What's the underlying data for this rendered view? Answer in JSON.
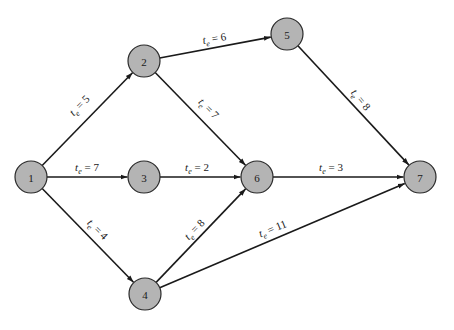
{
  "diagram": {
    "type": "activity-on-node network (PERT)",
    "node_radius": 16,
    "colors": {
      "node_fill": "#b4b4b4",
      "node_stroke": "#2a2a2a",
      "edge": "#1a1a1a",
      "background": "#ffffff"
    },
    "nodes": [
      {
        "id": "1",
        "label": "1",
        "x": 31,
        "y": 177
      },
      {
        "id": "2",
        "label": "2",
        "x": 144,
        "y": 61
      },
      {
        "id": "3",
        "label": "3",
        "x": 144,
        "y": 177
      },
      {
        "id": "4",
        "label": "4",
        "x": 145,
        "y": 294
      },
      {
        "id": "5",
        "label": "5",
        "x": 287,
        "y": 34
      },
      {
        "id": "6",
        "label": "6",
        "x": 257,
        "y": 177
      },
      {
        "id": "7",
        "label": "7",
        "x": 420,
        "y": 177
      }
    ],
    "edges": [
      {
        "from": "1",
        "to": "2",
        "var": "t",
        "sub": "e",
        "value": "5",
        "label": "t_e = 5",
        "lx": 82,
        "ly": 108,
        "angle": -46
      },
      {
        "from": "1",
        "to": "3",
        "var": "t",
        "sub": "e",
        "value": "7",
        "label": "t_e = 7",
        "lx": 87,
        "ly": 171,
        "angle": 0
      },
      {
        "from": "1",
        "to": "4",
        "var": "t",
        "sub": "e",
        "value": "4",
        "label": "t_e = 4",
        "lx": 95,
        "ly": 232,
        "angle": 45
      },
      {
        "from": "2",
        "to": "5",
        "var": "t",
        "sub": "e",
        "value": "6",
        "label": "t_e = 6",
        "lx": 215,
        "ly": 42,
        "angle": -10
      },
      {
        "from": "2",
        "to": "6",
        "var": "t",
        "sub": "e",
        "value": "7",
        "label": "t_e = 7",
        "lx": 206,
        "ly": 111,
        "angle": 46
      },
      {
        "from": "3",
        "to": "6",
        "var": "t",
        "sub": "e",
        "value": "2",
        "label": "t_e = 2",
        "lx": 197,
        "ly": 171,
        "angle": 0
      },
      {
        "from": "4",
        "to": "6",
        "var": "t",
        "sub": "e",
        "value": "8",
        "label": "t_e = 8",
        "lx": 197,
        "ly": 232,
        "angle": -46
      },
      {
        "from": "5",
        "to": "7",
        "var": "t",
        "sub": "e",
        "value": "8",
        "label": "t_e = 8",
        "lx": 358,
        "ly": 102,
        "angle": 51
      },
      {
        "from": "6",
        "to": "7",
        "var": "t",
        "sub": "e",
        "value": "3",
        "label": "t_e = 3",
        "lx": 331,
        "ly": 171,
        "angle": 0
      },
      {
        "from": "4",
        "to": "7",
        "var": "t",
        "sub": "e",
        "value": "11",
        "label": "t_e = 11",
        "lx": 274,
        "ly": 232,
        "angle": -22
      }
    ]
  }
}
